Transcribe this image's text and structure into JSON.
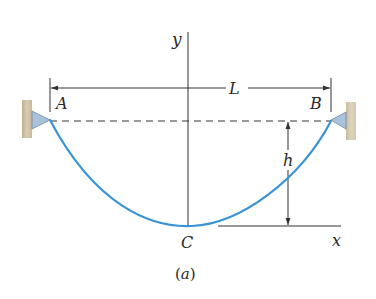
{
  "figure": {
    "caption": "(a)",
    "caption_letter": "a",
    "labels": {
      "y_axis": "y",
      "x_axis": "x",
      "span": "L",
      "left_support": "A",
      "right_support": "B",
      "sag": "h",
      "lowest_point": "C"
    },
    "colors": {
      "cable": "#3a94d4",
      "line": "#333333",
      "wall": "#cfc3a4",
      "support": "#a9c3dc"
    }
  }
}
